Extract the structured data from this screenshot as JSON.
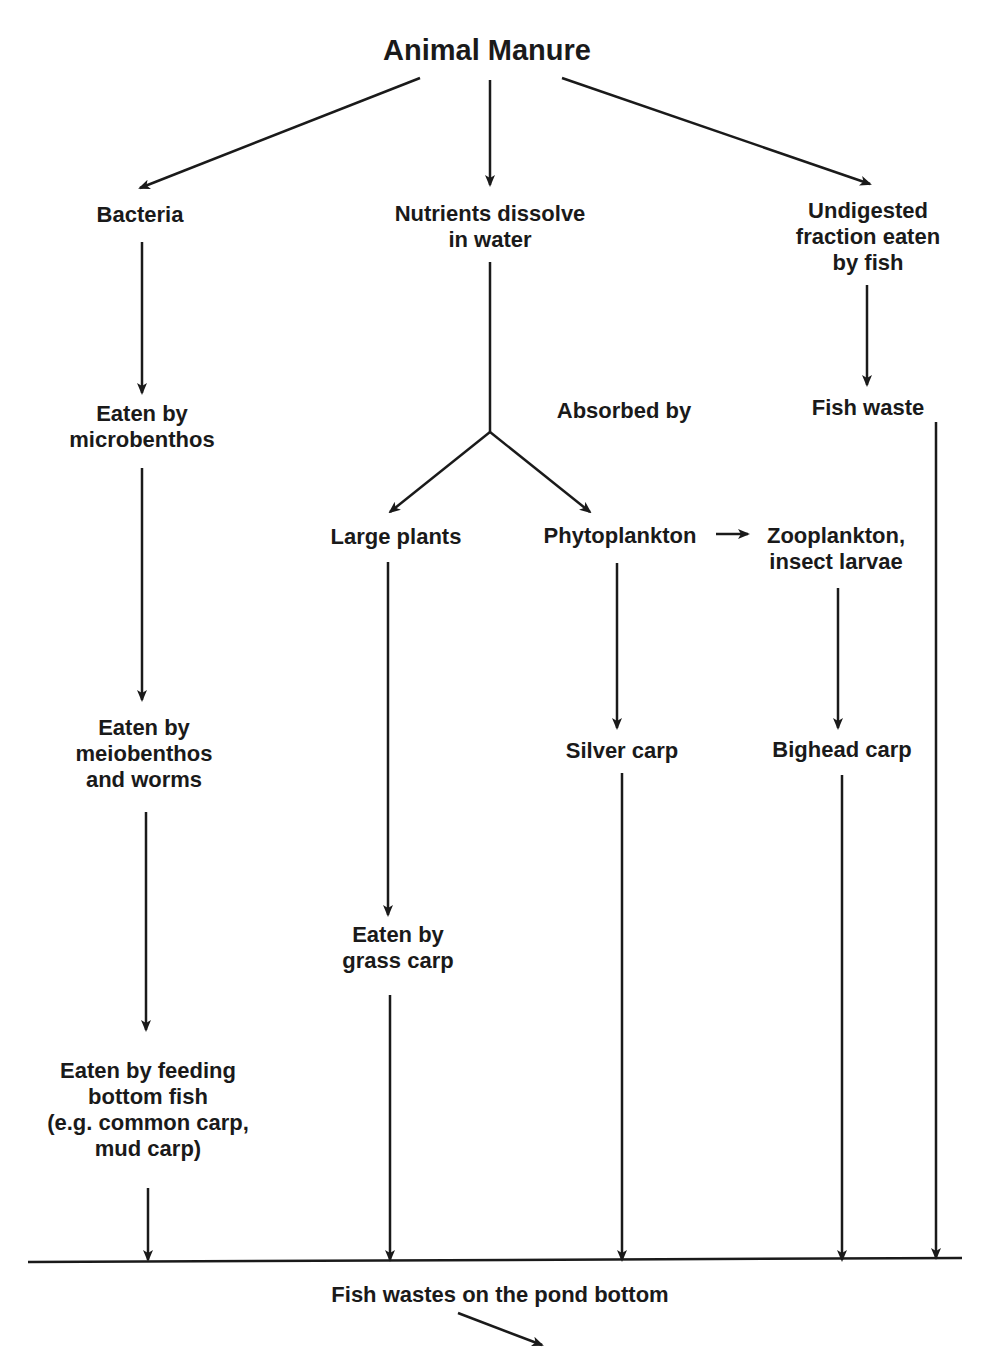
{
  "title": "Animal Manure",
  "page_number_partial": "",
  "nodes": {
    "bacteria": {
      "lines": [
        "Bacteria"
      ]
    },
    "nutrients": {
      "lines": [
        "Nutrients dissolve",
        "in water"
      ]
    },
    "undigested": {
      "lines": [
        "Undigested",
        "fraction eaten",
        "by fish"
      ]
    },
    "microbenthos": {
      "lines": [
        "Eaten by",
        "microbenthos"
      ]
    },
    "absorbed": {
      "lines": [
        "Absorbed by"
      ]
    },
    "fish_waste": {
      "lines": [
        "Fish waste"
      ]
    },
    "large_plants": {
      "lines": [
        "Large plants"
      ]
    },
    "phytoplankton": {
      "lines": [
        "Phytoplankton"
      ]
    },
    "zooplankton": {
      "lines": [
        "Zooplankton,",
        "insect larvae"
      ]
    },
    "meiobenthos": {
      "lines": [
        "Eaten by",
        "meiobenthos",
        "and worms"
      ]
    },
    "silver_carp": {
      "lines": [
        "Silver carp"
      ]
    },
    "bighead_carp": {
      "lines": [
        "Bighead carp"
      ]
    },
    "grass_carp": {
      "lines": [
        "Eaten by",
        "grass carp"
      ]
    },
    "bottom_fish": {
      "lines": [
        "Eaten by feeding",
        "bottom fish",
        "(e.g. common carp,",
        "mud carp)"
      ]
    },
    "pond_bottom": {
      "lines": [
        "Fish wastes on the pond bottom"
      ]
    }
  },
  "colors": {
    "ink": "#1a1a1a",
    "background": "#ffffff"
  }
}
